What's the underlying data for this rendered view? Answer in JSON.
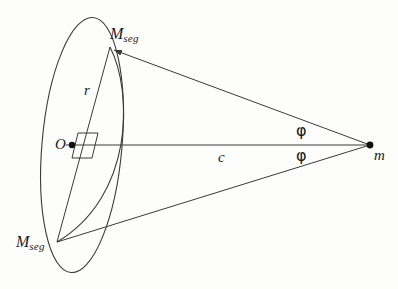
{
  "figure": {
    "type": "geometry-diagram",
    "background_color": "#fdfdfc",
    "stroke_color": "#3a3a3a",
    "labels": {
      "m_seg_top": {
        "symbol": "M",
        "subscript": "seg"
      },
      "m_seg_bottom": {
        "symbol": "M",
        "subscript": "seg"
      },
      "radius": "r",
      "center": "O",
      "axis": "c",
      "mass_point": "m",
      "angle_top": "φ",
      "angle_bottom": "φ"
    },
    "points": {
      "O": {
        "x": 72,
        "y": 145
      },
      "m": {
        "x": 370,
        "y": 145
      },
      "M_seg_top": {
        "x": 110,
        "y": 47
      },
      "M_seg_bottom": {
        "x": 57,
        "y": 242
      }
    },
    "ellipse": {
      "center_x": 82,
      "center_y": 145,
      "radius_x": 40,
      "radius_y": 128,
      "rotation_deg": 5
    },
    "inner_arc": {
      "description": "near-edge arc of the disk passing through both M_seg points"
    }
  }
}
